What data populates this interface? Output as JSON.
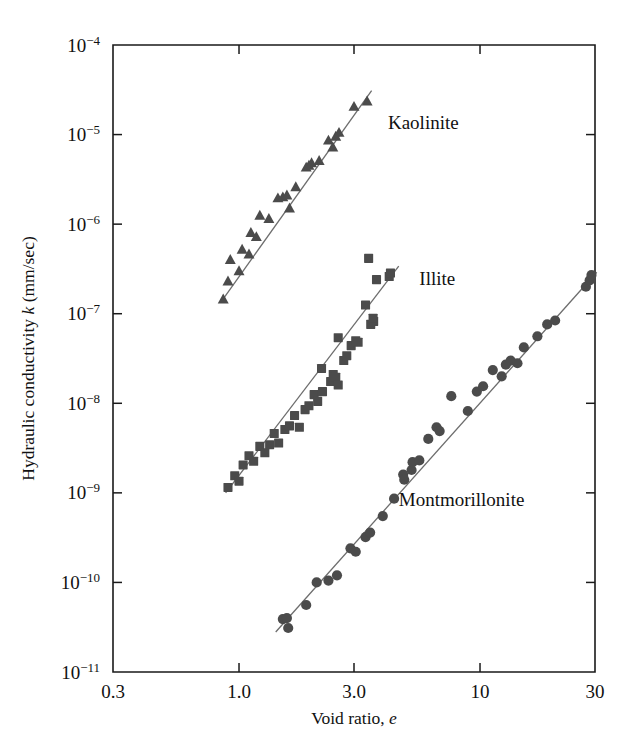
{
  "figure": {
    "background": "#ffffff",
    "marker_color": "#4b4b4b",
    "line_color": "#6d6d6d",
    "axis_color": "#1a1a1a"
  },
  "axes": {
    "x": {
      "label_prefix": "Void ratio, ",
      "label_italic": "e",
      "scale": "log",
      "min": 0.3,
      "max": 30,
      "ticks": [
        0.3,
        1.0,
        3.0,
        10,
        30
      ],
      "ticklabels": [
        "0.3",
        "1.0",
        "3.0",
        "10",
        "30"
      ]
    },
    "y": {
      "label_prefix": "Hydraulic conductivity ",
      "label_italic": "k",
      "label_suffix": " (mm/sec)",
      "scale": "log",
      "min": 1e-11,
      "max": 0.0001,
      "ticks": [
        -4,
        -5,
        -6,
        -7,
        -8,
        -9,
        -10,
        -11
      ],
      "ticklabels": [
        "10−4",
        "10−5",
        "10−6",
        "10−7",
        "10−8",
        "10−9",
        "10−10",
        "10−11"
      ]
    }
  },
  "chart_data": {
    "type": "scatter",
    "title": "",
    "xlabel": "Void ratio, e",
    "ylabel": "Hydraulic conductivity k (mm/sec)",
    "xscale": "log",
    "yscale": "log",
    "xlim": [
      0.3,
      30
    ],
    "ylim": [
      1e-11,
      0.0001
    ],
    "grid": false,
    "legend": "inline-annotations",
    "series": [
      {
        "name": "Kaolinite",
        "marker": "triangle",
        "color": "#4b4b4b",
        "label_x": 4.15,
        "label_y": 1.15e-05,
        "trendline": {
          "x": [
            0.85,
            3.55
          ],
          "y": [
            1.4e-07,
            3.1e-05
          ]
        },
        "points": [
          [
            0.86,
            1.45e-07
          ],
          [
            0.9,
            2.3e-07
          ],
          [
            0.92,
            4e-07
          ],
          [
            1.0,
            3e-07
          ],
          [
            1.03,
            5.2e-07
          ],
          [
            1.12,
            8e-07
          ],
          [
            1.1,
            4.6e-07
          ],
          [
            1.22,
            1.25e-06
          ],
          [
            1.18,
            7.2e-07
          ],
          [
            1.33,
            1.15e-06
          ],
          [
            1.45,
            1.95e-06
          ],
          [
            1.52,
            2e-06
          ],
          [
            1.58,
            2.1e-06
          ],
          [
            1.62,
            1.5e-06
          ],
          [
            1.72,
            2.6e-06
          ],
          [
            1.9,
            4.3e-06
          ],
          [
            1.95,
            4.5e-06
          ],
          [
            2.0,
            4.8e-06
          ],
          [
            2.15,
            5.1e-06
          ],
          [
            2.35,
            8.6e-06
          ],
          [
            2.45,
            7.2e-06
          ],
          [
            2.52,
            9.5e-06
          ],
          [
            2.6,
            1.05e-05
          ],
          [
            3.0,
            2.05e-05
          ],
          [
            3.4,
            2.35e-05
          ]
        ]
      },
      {
        "name": "Illite",
        "marker": "square",
        "color": "#4b4b4b",
        "label_x": 5.6,
        "label_y": 2.1e-07,
        "trendline": {
          "x": [
            0.88,
            4.6
          ],
          "y": [
            1e-09,
            3.4e-07
          ]
        },
        "points": [
          [
            0.9,
            1.15e-09
          ],
          [
            0.96,
            1.55e-09
          ],
          [
            1.0,
            1.35e-09
          ],
          [
            1.04,
            2.05e-09
          ],
          [
            1.1,
            2.6e-09
          ],
          [
            1.15,
            2.25e-09
          ],
          [
            1.22,
            3.3e-09
          ],
          [
            1.28,
            2.8e-09
          ],
          [
            1.34,
            3.45e-09
          ],
          [
            1.4,
            4.6e-09
          ],
          [
            1.46,
            3.6e-09
          ],
          [
            1.55,
            5.1e-09
          ],
          [
            1.62,
            5.6e-09
          ],
          [
            1.7,
            7.3e-09
          ],
          [
            1.78,
            5.4e-09
          ],
          [
            1.88,
            8.5e-09
          ],
          [
            1.95,
            9.4e-09
          ],
          [
            2.05,
            1.25e-08
          ],
          [
            2.12,
            1.05e-08
          ],
          [
            2.22,
            1.35e-08
          ],
          [
            2.2,
            2.45e-08
          ],
          [
            2.4,
            1.75e-08
          ],
          [
            2.46,
            2.1e-08
          ],
          [
            2.52,
            1.95e-08
          ],
          [
            2.58,
            1.6e-08
          ],
          [
            2.72,
            3e-08
          ],
          [
            2.8,
            3.4e-08
          ],
          [
            2.58,
            5.4e-08
          ],
          [
            2.92,
            4.4e-08
          ],
          [
            3.05,
            5e-08
          ],
          [
            3.12,
            4.8e-08
          ],
          [
            3.35,
            1.25e-07
          ],
          [
            3.52,
            7.6e-08
          ],
          [
            3.62,
            8.2e-08
          ],
          [
            3.6,
            8.9e-08
          ],
          [
            3.45,
            4.15e-07
          ],
          [
            3.72,
            2.4e-07
          ],
          [
            4.2,
            2.6e-07
          ],
          [
            4.25,
            2.85e-07
          ]
        ]
      },
      {
        "name": "Montmorillonite",
        "marker": "circle",
        "color": "#4b4b4b",
        "label_x": 4.6,
        "label_y": 7.2e-10,
        "trendline": {
          "x": [
            1.42,
            30.5
          ],
          "y": [
            2.8e-11,
            2.9e-07
          ]
        },
        "points": [
          [
            1.52,
            3.9e-11
          ],
          [
            1.58,
            4e-11
          ],
          [
            1.6,
            3.1e-11
          ],
          [
            1.9,
            5.6e-11
          ],
          [
            2.1,
            1e-10
          ],
          [
            2.35,
            1.05e-10
          ],
          [
            2.55,
            1.2e-10
          ],
          [
            2.9,
            2.4e-10
          ],
          [
            3.05,
            2.2e-10
          ],
          [
            3.35,
            3.2e-10
          ],
          [
            3.5,
            3.6e-10
          ],
          [
            3.95,
            5.5e-10
          ],
          [
            4.4,
            8.6e-10
          ],
          [
            4.8,
            1.6e-09
          ],
          [
            4.85,
            1.4e-09
          ],
          [
            5.2,
            1.8e-09
          ],
          [
            5.25,
            2.2e-09
          ],
          [
            5.6,
            2.3e-09
          ],
          [
            6.1,
            4e-09
          ],
          [
            6.6,
            5.4e-09
          ],
          [
            6.8,
            4.9e-09
          ],
          [
            7.6,
            1.2e-08
          ],
          [
            8.9,
            8.2e-09
          ],
          [
            9.7,
            1.35e-08
          ],
          [
            10.3,
            1.55e-08
          ],
          [
            11.3,
            2.35e-08
          ],
          [
            12.3,
            2e-08
          ],
          [
            12.8,
            2.7e-08
          ],
          [
            13.4,
            3e-08
          ],
          [
            14.3,
            2.8e-08
          ],
          [
            15.2,
            4.2e-08
          ],
          [
            17.3,
            5.6e-08
          ],
          [
            19.0,
            7.6e-08
          ],
          [
            20.5,
            8.4e-08
          ],
          [
            27.5,
            2e-07
          ],
          [
            28.5,
            2.35e-07
          ],
          [
            29.0,
            2.7e-07
          ]
        ]
      }
    ]
  }
}
